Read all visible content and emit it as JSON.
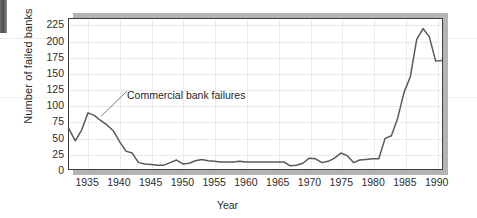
{
  "chart_data": {
    "type": "line",
    "title": "",
    "xlabel": "Year",
    "ylabel": "Number of failed banks",
    "xlim": [
      1932,
      1991
    ],
    "ylim": [
      0,
      235
    ],
    "grid": true,
    "legend_position": "none",
    "y_ticks": [
      225,
      200,
      175,
      150,
      125,
      100,
      75,
      50,
      25,
      0
    ],
    "x_ticks": [
      1935,
      1940,
      1945,
      1950,
      1955,
      1960,
      1965,
      1970,
      1975,
      1980,
      1985,
      1990
    ],
    "annotations": [
      {
        "text": "Commercial bank failures",
        "points_to_year": 1936,
        "points_to_value": 84
      }
    ],
    "series": [
      {
        "name": "Commercial bank failures",
        "color": "#595959",
        "x": [
          1932,
          1933,
          1934,
          1935,
          1936,
          1937,
          1938,
          1939,
          1940,
          1941,
          1942,
          1943,
          1944,
          1945,
          1946,
          1947,
          1948,
          1949,
          1950,
          1951,
          1952,
          1953,
          1954,
          1955,
          1956,
          1957,
          1958,
          1959,
          1960,
          1961,
          1962,
          1963,
          1964,
          1965,
          1966,
          1967,
          1968,
          1969,
          1970,
          1971,
          1972,
          1973,
          1974,
          1975,
          1976,
          1977,
          1978,
          1979,
          1980,
          1981,
          1982,
          1983,
          1984,
          1985,
          1986,
          1987,
          1988,
          1989,
          1990,
          1991
        ],
        "values": [
          63,
          44,
          61,
          88,
          84,
          76,
          69,
          60,
          43,
          28,
          25,
          10,
          8,
          7,
          6,
          6,
          10,
          14,
          8,
          9,
          13,
          15,
          13,
          12,
          11,
          11,
          11,
          12,
          11,
          11,
          11,
          11,
          11,
          11,
          11,
          5,
          6,
          9,
          17,
          16,
          10,
          12,
          17,
          25,
          21,
          10,
          14,
          15,
          16,
          16,
          48,
          52,
          80,
          120,
          145,
          203,
          220,
          207,
          169,
          170
        ]
      }
    ]
  },
  "axis": {
    "y_title": "Number of failed banks",
    "x_title": "Year"
  }
}
